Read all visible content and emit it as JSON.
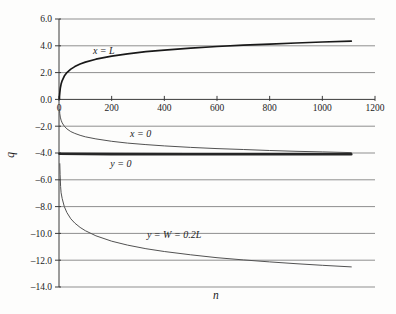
{
  "figure": {
    "background": "#fdfdfc",
    "grid_color": "#8f8f8f",
    "axis_color": "#3a3a3a",
    "text_color": "#1c1c1c"
  },
  "chart_data": {
    "type": "line",
    "title": "",
    "xlabel": "n",
    "ylabel": "q",
    "xlim": [
      0,
      1200
    ],
    "ylim": [
      -14,
      6
    ],
    "grid": true,
    "legend_position": "none (inline curve labels)",
    "x_ticks": [
      0,
      200,
      400,
      600,
      800,
      1000,
      1200
    ],
    "x_tick_labels": [
      "0",
      "200",
      "400",
      "600",
      "800",
      "1000",
      "1200"
    ],
    "y_ticks": [
      6,
      4,
      2,
      0,
      -2,
      -4,
      -6,
      -8,
      -10,
      -12,
      -14
    ],
    "y_tick_labels": [
      "6.0",
      "4.0",
      "2.0",
      "0.0",
      "–2.0",
      "–4.0",
      "–6.0",
      "–8.0",
      "–10.0",
      "–12.0",
      "–14.0"
    ],
    "series": [
      {
        "name": "x = L",
        "color": "#191919",
        "width": 1.7,
        "points": [
          [
            1.5,
            0.05
          ],
          [
            2,
            0.24
          ],
          [
            3,
            0.5
          ],
          [
            5,
            0.84
          ],
          [
            8,
            1.14
          ],
          [
            12,
            1.4
          ],
          [
            20,
            1.74
          ],
          [
            30,
            2.0
          ],
          [
            45,
            2.26
          ],
          [
            60,
            2.45
          ],
          [
            80,
            2.64
          ],
          [
            100,
            2.78
          ],
          [
            140,
            3.0
          ],
          [
            200,
            3.23
          ],
          [
            260,
            3.4
          ],
          [
            330,
            3.56
          ],
          [
            400,
            3.68
          ],
          [
            500,
            3.83
          ],
          [
            600,
            3.95
          ],
          [
            700,
            4.05
          ],
          [
            800,
            4.13
          ],
          [
            900,
            4.21
          ],
          [
            1000,
            4.28
          ],
          [
            1110,
            4.35
          ]
        ]
      },
      {
        "name": "x = 0",
        "color": "#525252",
        "width": 1.0,
        "points": [
          [
            2,
            -0.75
          ],
          [
            3,
            -1.07
          ],
          [
            5,
            -1.32
          ],
          [
            8,
            -1.55
          ],
          [
            12,
            -1.75
          ],
          [
            20,
            -2.0
          ],
          [
            30,
            -2.2
          ],
          [
            45,
            -2.4
          ],
          [
            60,
            -2.54
          ],
          [
            80,
            -2.68
          ],
          [
            100,
            -2.79
          ],
          [
            140,
            -2.95
          ],
          [
            200,
            -3.13
          ],
          [
            260,
            -3.26
          ],
          [
            330,
            -3.37
          ],
          [
            400,
            -3.47
          ],
          [
            500,
            -3.58
          ],
          [
            600,
            -3.67
          ],
          [
            700,
            -3.74
          ],
          [
            800,
            -3.81
          ],
          [
            900,
            -3.87
          ],
          [
            1000,
            -3.92
          ],
          [
            1110,
            -3.97
          ]
        ]
      },
      {
        "name": "y = 0",
        "color": "#262626",
        "width": 2.6,
        "points": [
          [
            2,
            -4.05
          ],
          [
            200,
            -4.08
          ],
          [
            500,
            -4.1
          ],
          [
            800,
            -4.1
          ],
          [
            1110,
            -4.1
          ]
        ]
      },
      {
        "name": "y = W = 0.2L",
        "color": "#525252",
        "width": 1.0,
        "points": [
          [
            3,
            -4.8
          ],
          [
            4,
            -5.6
          ],
          [
            6,
            -6.5
          ],
          [
            8,
            -6.97
          ],
          [
            12,
            -7.4
          ],
          [
            20,
            -8.0
          ],
          [
            30,
            -8.45
          ],
          [
            45,
            -8.91
          ],
          [
            60,
            -9.23
          ],
          [
            80,
            -9.55
          ],
          [
            100,
            -9.8
          ],
          [
            140,
            -10.18
          ],
          [
            200,
            -10.58
          ],
          [
            260,
            -10.87
          ],
          [
            330,
            -11.14
          ],
          [
            400,
            -11.35
          ],
          [
            500,
            -11.6
          ],
          [
            600,
            -11.81
          ],
          [
            700,
            -11.98
          ],
          [
            800,
            -12.13
          ],
          [
            900,
            -12.26
          ],
          [
            1000,
            -12.38
          ],
          [
            1110,
            -12.5
          ]
        ]
      }
    ],
    "annotations": [
      {
        "text": "x = L",
        "n": 170,
        "q": 3.6
      },
      {
        "text": "x = 0",
        "n": 310,
        "q": -2.58
      },
      {
        "text": "y = 0",
        "n": 235,
        "q": -4.78
      },
      {
        "text": "y = W = 0.2L",
        "n": 437,
        "q": -10.1
      }
    ]
  }
}
